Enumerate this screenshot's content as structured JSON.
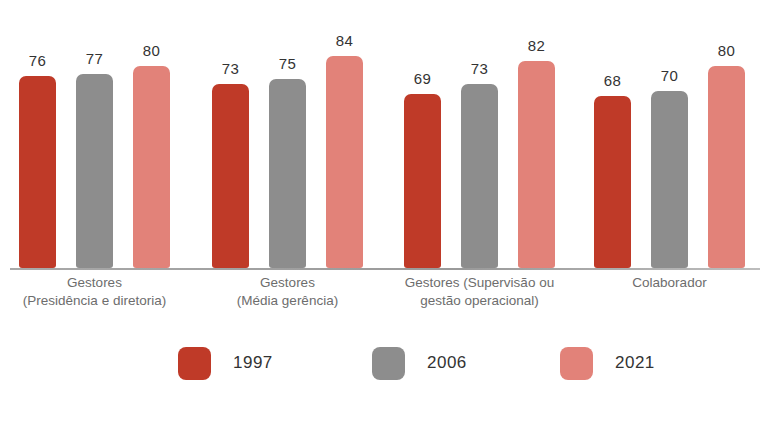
{
  "chart_data": {
    "type": "bar",
    "title": "",
    "subtitle": "",
    "xlabel": "",
    "ylabel": "",
    "grid": false,
    "axis_visible": false,
    "legend_position": "bottom",
    "ylim": [
      0,
      84
    ],
    "value_labels": true,
    "categories": [
      "Gestores (Presidência e diretoria)",
      "Gestores (Média gerência)",
      "Gestores (Supervisão ou gestão operacional)",
      "Colaborador"
    ],
    "category_lines": [
      [
        "Gestores",
        "(Presidência e diretoria)"
      ],
      [
        "Gestores",
        "(Média gerência)"
      ],
      [
        "Gestores (Supervisão ou",
        "gestão operacional)"
      ],
      [
        "Colaborador",
        ""
      ]
    ],
    "series": [
      {
        "name": "1997",
        "color": "#bf3a28",
        "values": [
          76,
          73,
          69,
          68
        ]
      },
      {
        "name": "2006",
        "color": "#8d8d8d",
        "values": [
          77,
          75,
          73,
          70
        ]
      },
      {
        "name": "2021",
        "color": "#e28279",
        "values": [
          80,
          84,
          82,
          80
        ]
      }
    ]
  },
  "legend": {
    "items": [
      {
        "label": "1997",
        "color": "#bf3a28"
      },
      {
        "label": "2006",
        "color": "#8d8d8d"
      },
      {
        "label": "2021",
        "color": "#e28279"
      }
    ]
  }
}
